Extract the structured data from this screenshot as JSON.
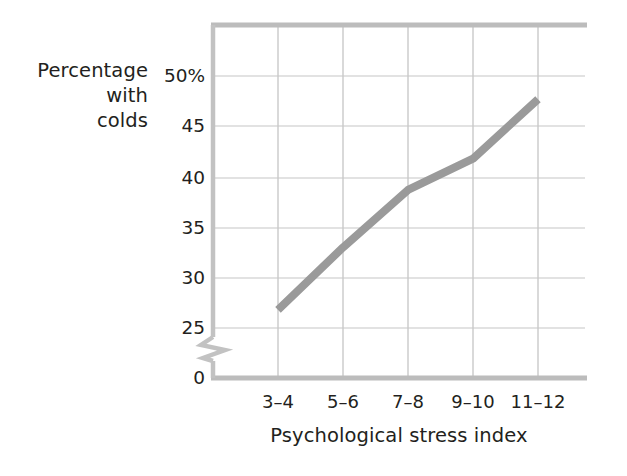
{
  "chart_data": {
    "type": "line",
    "title": "",
    "subtitle": "",
    "xlabel": "Psychological stress index",
    "ylabel": "Percentage with colds",
    "ylabel_lines": [
      "Percentage",
      "with",
      "colds"
    ],
    "categories": [
      "3–4",
      "5–6",
      "7–8",
      "9–10",
      "11–12"
    ],
    "series": [
      {
        "name": "Percentage with colds",
        "values": [
          26.8,
          33.0,
          38.7,
          41.8,
          47.7
        ],
        "color": "#9a9a9a",
        "line_width": 8
      }
    ],
    "x_tick_labels": [
      "3–4",
      "5–6",
      "7–8",
      "9–10",
      "11–12"
    ],
    "y_tick_labels": [
      "50%",
      "45",
      "40",
      "35",
      "30",
      "25",
      "0"
    ],
    "y_tick_values": [
      50,
      45,
      40,
      35,
      30,
      25,
      0
    ],
    "ylim": [
      25,
      52.5
    ],
    "y_axis_break": true,
    "y_axis_break_between": [
      0,
      25
    ],
    "grid": true,
    "grid_color": "#d7d7d7",
    "axis_color": "#c3c3c3",
    "legend": false,
    "legend_position": "none",
    "background": "#ffffff"
  },
  "colors": {
    "line": "#9a9a9a",
    "grid": "#d9d9d9",
    "axis": "#c6c6c6",
    "text": "#231f20",
    "background": "#ffffff"
  }
}
